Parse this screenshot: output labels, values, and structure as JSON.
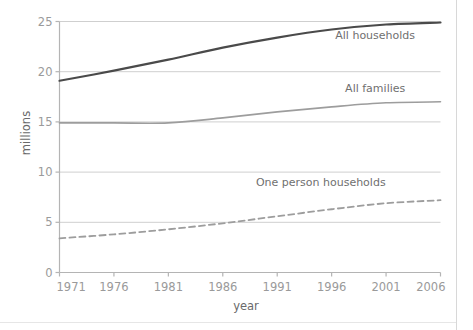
{
  "chart_data": {
    "type": "line",
    "title": "",
    "xlabel": "year",
    "ylabel": "millions",
    "xlim": [
      1971,
      2006
    ],
    "ylim": [
      0,
      25
    ],
    "grid": true,
    "legend_position": "inline-right-of-series",
    "x_ticks": [
      "1971",
      "1976",
      "1981",
      "1986",
      "1991",
      "1996",
      "2001",
      "2006"
    ],
    "y_ticks": [
      "0",
      "5",
      "10",
      "15",
      "20",
      "25"
    ],
    "x": [
      1971,
      1976,
      1981,
      1986,
      1991,
      1996,
      2001,
      2006
    ],
    "series": [
      {
        "name": "All households",
        "style": "solid",
        "color": "#4a4a4a",
        "width": 2.2,
        "values": [
          19.1,
          20.1,
          21.2,
          22.4,
          23.4,
          24.2,
          24.7,
          24.9
        ],
        "label_x": 2000,
        "label_y": 23.3
      },
      {
        "name": "All families",
        "style": "solid",
        "color": "#9d9d9d",
        "width": 1.6,
        "values": [
          14.9,
          14.9,
          14.9,
          15.4,
          16.0,
          16.5,
          16.9,
          17.0
        ],
        "label_x": 2000,
        "label_y": 18.0
      },
      {
        "name": "One person households",
        "style": "dashed",
        "color": "#9d9d9d",
        "width": 1.8,
        "values": [
          3.4,
          3.8,
          4.3,
          4.9,
          5.6,
          6.3,
          6.9,
          7.2
        ],
        "label_x": 1995,
        "label_y": 8.6
      }
    ]
  },
  "colors": {
    "background": "#ffffff",
    "grid": "#cfcfcf",
    "axis": "#b4b4b4",
    "tick_text": "#9a9a9a",
    "axis_title": "#6a6a6a",
    "series_label": "#6f6f6f",
    "dark_series": "#4a4a4a",
    "grey_series": "#9d9d9d"
  }
}
